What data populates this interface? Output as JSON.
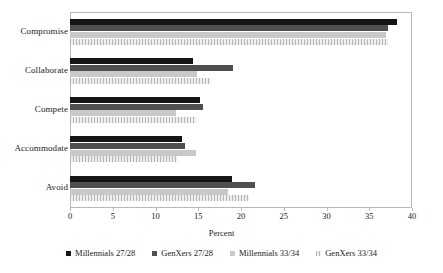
{
  "chart_data": {
    "type": "bar",
    "orientation": "horizontal",
    "title": "",
    "xlabel": "Percent",
    "ylabel": "",
    "xlim": [
      0,
      40
    ],
    "xticks": [
      0,
      5,
      10,
      15,
      20,
      25,
      30,
      35,
      40
    ],
    "grid": false,
    "legend_position": "bottom",
    "categories": [
      "Compromise",
      "Collaborate",
      "Compete",
      "Accommodate",
      "Avoid"
    ],
    "series": [
      {
        "name": "Millennials 27/28",
        "color": "#151515",
        "values": [
          38.2,
          14.4,
          15.2,
          13.1,
          19.0
        ]
      },
      {
        "name": "GenXers 27/28",
        "color": "#4f4f4f",
        "values": [
          37.2,
          19.1,
          15.5,
          13.5,
          21.6
        ]
      },
      {
        "name": "Millennials 33/34",
        "color": "#c9c9c9",
        "values": [
          37.0,
          14.9,
          12.4,
          14.7,
          18.5
        ]
      },
      {
        "name": "GenXers 33/34",
        "color": "#dcdcdc",
        "values": [
          37.2,
          16.5,
          14.7,
          12.5,
          20.9
        ]
      }
    ]
  }
}
